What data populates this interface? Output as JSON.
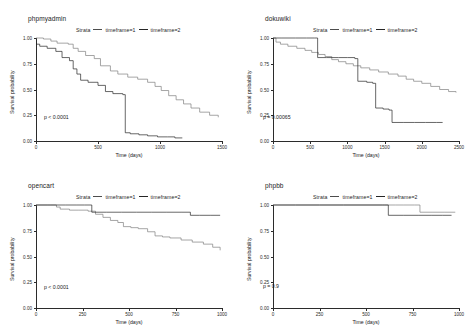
{
  "figure": {
    "background": "#ffffff",
    "panel_count": 4,
    "colors": {
      "strata1": "#7f7f7f",
      "strata2": "#262626",
      "axis": "#2b2b2b",
      "text": "#1a1a1a"
    }
  },
  "legend": {
    "title": "Strata",
    "entries": [
      {
        "label": "timeframe=1",
        "color": "#7f7f7f"
      },
      {
        "label": "timeframe=2",
        "color": "#262626"
      }
    ]
  },
  "axes": {
    "ylabel": "Survival probability",
    "xlabel": "Time (days)",
    "yticks": [
      "0.00",
      "0.25",
      "0.50",
      "0.75",
      "1.00"
    ]
  },
  "chart_data": [
    {
      "type": "line",
      "title": "phpmyadmin",
      "xlabel": "Time (days)",
      "ylabel": "Survival probability",
      "xlim": [
        0,
        1500
      ],
      "ylim": [
        0.0,
        1.0
      ],
      "xticks": [
        0,
        500,
        1000,
        1500
      ],
      "yticks": [
        0.0,
        0.25,
        0.5,
        0.75,
        1.0
      ],
      "grid": false,
      "legend_position": "top",
      "annotation": "p < 0.0001",
      "series": [
        {
          "name": "timeframe=1",
          "color": "#7f7f7f",
          "step": true,
          "x": [
            0,
            20,
            60,
            120,
            170,
            260,
            300,
            340,
            400,
            470,
            520,
            600,
            660,
            740,
            820,
            900,
            960,
            1010,
            1070,
            1130,
            1190,
            1250,
            1320,
            1400,
            1470
          ],
          "y": [
            1.0,
            1.0,
            0.99,
            0.97,
            0.95,
            0.94,
            0.9,
            0.87,
            0.83,
            0.8,
            0.73,
            0.68,
            0.65,
            0.62,
            0.6,
            0.57,
            0.53,
            0.49,
            0.44,
            0.4,
            0.36,
            0.32,
            0.28,
            0.25,
            0.23
          ]
        },
        {
          "name": "timeframe=2",
          "color": "#262626",
          "step": true,
          "x": [
            0,
            30,
            90,
            160,
            210,
            270,
            300,
            330,
            360,
            420,
            500,
            560,
            620,
            700,
            720,
            760,
            830,
            900,
            980,
            1060,
            1120,
            1180
          ],
          "y": [
            0.94,
            0.92,
            0.9,
            0.87,
            0.81,
            0.78,
            0.7,
            0.65,
            0.59,
            0.57,
            0.54,
            0.48,
            0.46,
            0.45,
            0.08,
            0.07,
            0.06,
            0.05,
            0.04,
            0.04,
            0.03,
            0.03
          ]
        }
      ]
    },
    {
      "type": "line",
      "title": "dokuwiki",
      "xlabel": "Time (days)",
      "ylabel": "Survival probability",
      "xlim": [
        0,
        2500
      ],
      "ylim": [
        0.0,
        1.0
      ],
      "xticks": [
        0,
        500,
        1000,
        1500,
        2000,
        2500
      ],
      "yticks": [
        0.0,
        0.25,
        0.5,
        0.75,
        1.0
      ],
      "grid": false,
      "legend_position": "top",
      "annotation": "p = 0.00065",
      "series": [
        {
          "name": "timeframe=1",
          "color": "#7f7f7f",
          "step": true,
          "x": [
            0,
            40,
            100,
            200,
            320,
            430,
            520,
            610,
            700,
            790,
            880,
            980,
            1080,
            1180,
            1300,
            1420,
            1550,
            1680,
            1790,
            1890,
            2000,
            2120,
            2240,
            2360,
            2460
          ],
          "y": [
            1.0,
            0.96,
            0.94,
            0.92,
            0.9,
            0.88,
            0.86,
            0.84,
            0.82,
            0.79,
            0.77,
            0.75,
            0.73,
            0.71,
            0.69,
            0.67,
            0.65,
            0.63,
            0.6,
            0.58,
            0.56,
            0.53,
            0.5,
            0.48,
            0.47
          ]
        },
        {
          "name": "timeframe=2",
          "color": "#262626",
          "step": true,
          "x": [
            0,
            120,
            300,
            450,
            560,
            600,
            720,
            880,
            1000,
            1100,
            1140,
            1260,
            1340,
            1380,
            1480,
            1560,
            1600,
            1750,
            1900,
            2050,
            2200,
            2280
          ],
          "y": [
            1.0,
            1.0,
            1.0,
            1.0,
            1.0,
            0.81,
            0.81,
            0.81,
            0.81,
            0.8,
            0.58,
            0.57,
            0.56,
            0.32,
            0.31,
            0.3,
            0.18,
            0.18,
            0.18,
            0.18,
            0.18,
            0.18
          ]
        }
      ]
    },
    {
      "type": "line",
      "title": "opencart",
      "xlabel": "Time (days)",
      "ylabel": "Survival probability",
      "xlim": [
        0,
        1000
      ],
      "ylim": [
        0.0,
        1.0
      ],
      "xticks": [
        0,
        250,
        500,
        750,
        1000
      ],
      "yticks": [
        0.0,
        0.25,
        0.5,
        0.75,
        1.0
      ],
      "grid": false,
      "legend_position": "top",
      "annotation": "p < 0.0001",
      "series": [
        {
          "name": "timeframe=1",
          "color": "#7f7f7f",
          "step": true,
          "x": [
            0,
            60,
            110,
            130,
            180,
            230,
            280,
            320,
            360,
            400,
            440,
            470,
            510,
            550,
            600,
            640,
            680,
            720,
            780,
            840,
            900,
            950,
            990
          ],
          "y": [
            1.0,
            1.0,
            0.98,
            0.96,
            0.95,
            0.95,
            0.94,
            0.91,
            0.88,
            0.85,
            0.83,
            0.79,
            0.78,
            0.77,
            0.74,
            0.7,
            0.69,
            0.68,
            0.66,
            0.64,
            0.62,
            0.59,
            0.56
          ]
        },
        {
          "name": "timeframe=2",
          "color": "#262626",
          "step": true,
          "x": [
            0,
            80,
            160,
            220,
            260,
            300,
            380,
            460,
            540,
            620,
            700,
            780,
            830,
            880,
            940,
            990
          ],
          "y": [
            1.0,
            1.0,
            1.0,
            1.0,
            1.0,
            0.93,
            0.93,
            0.93,
            0.93,
            0.93,
            0.93,
            0.93,
            0.9,
            0.9,
            0.9,
            0.9
          ]
        }
      ]
    },
    {
      "type": "line",
      "title": "phpbb",
      "xlabel": "Time (days)",
      "ylabel": "Survival probability",
      "xlim": [
        0,
        1000
      ],
      "ylim": [
        0.0,
        1.0
      ],
      "xticks": [
        0,
        250,
        500,
        750,
        1000
      ],
      "yticks": [
        0.0,
        0.25,
        0.5,
        0.75,
        1.0
      ],
      "grid": false,
      "legend_position": "top",
      "annotation": "p = 0.9",
      "series": [
        {
          "name": "timeframe=1",
          "color": "#7f7f7f",
          "step": true,
          "x": [
            0,
            120,
            250,
            380,
            500,
            600,
            660,
            700,
            760,
            790,
            860,
            920,
            980
          ],
          "y": [
            1.0,
            1.0,
            1.0,
            1.0,
            1.0,
            1.0,
            1.0,
            1.0,
            1.0,
            0.93,
            0.93,
            0.93,
            0.93
          ]
        },
        {
          "name": "timeframe=2",
          "color": "#262626",
          "step": true,
          "x": [
            0,
            120,
            250,
            380,
            500,
            590,
            620,
            700,
            780,
            850,
            910,
            960
          ],
          "y": [
            1.0,
            1.0,
            1.0,
            1.0,
            1.0,
            1.0,
            0.9,
            0.9,
            0.9,
            0.9,
            0.9,
            0.9
          ]
        }
      ]
    }
  ]
}
